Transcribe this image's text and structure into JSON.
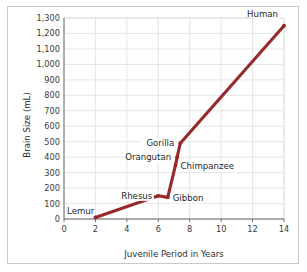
{
  "chart_data": {
    "type": "line",
    "title": "",
    "xlabel": "Juvenile Period in Years",
    "ylabel": "Brain Size (mL)",
    "xlim": [
      0,
      14
    ],
    "ylim": [
      0,
      1300
    ],
    "grid": true,
    "legend": "none",
    "xticks": [
      "0",
      "2",
      "4",
      "6",
      "8",
      "10",
      "12",
      "14"
    ],
    "xtick_values": [
      0,
      2,
      4,
      6,
      8,
      10,
      12,
      14
    ],
    "yticks": [
      "0",
      "100",
      "200",
      "300",
      "400",
      "500",
      "600",
      "700",
      "800",
      "900",
      "1,000",
      "1,100",
      "1,200",
      "1,300"
    ],
    "ytick_values": [
      0,
      100,
      200,
      300,
      400,
      500,
      600,
      700,
      800,
      900,
      1000,
      1100,
      1200,
      1300
    ],
    "series": [
      {
        "name": "Primate brain size vs juvenile period",
        "color": "#96292b",
        "x": [
          2,
          6,
          6.6,
          7.1,
          7.2,
          7.4,
          14
        ],
        "y": [
          10,
          150,
          140,
          350,
          400,
          490,
          1250
        ]
      }
    ],
    "annotations": [
      {
        "label": "Lemur",
        "x": 2,
        "y": 10,
        "anchor": "right-of-axis-bottom"
      },
      {
        "label": "Rhesus",
        "x": 6,
        "y": 150,
        "anchor": "left"
      },
      {
        "label": "Gibbon",
        "x": 6.6,
        "y": 140,
        "anchor": "right"
      },
      {
        "label": "Chimpanzee",
        "x": 7.1,
        "y": 350,
        "anchor": "right"
      },
      {
        "label": "Orangutan",
        "x": 7.2,
        "y": 400,
        "anchor": "left"
      },
      {
        "label": "Gorilla",
        "x": 7.4,
        "y": 490,
        "anchor": "left"
      },
      {
        "label": "Human",
        "x": 14,
        "y": 1250,
        "anchor": "upper-left"
      }
    ]
  },
  "colors": {
    "line": "#96292b",
    "grid": "#d5d5d5",
    "axis": "#6d6d6d",
    "frame": "#c9c9c9",
    "text": "#2e2e2e",
    "background": "#ffffff"
  }
}
